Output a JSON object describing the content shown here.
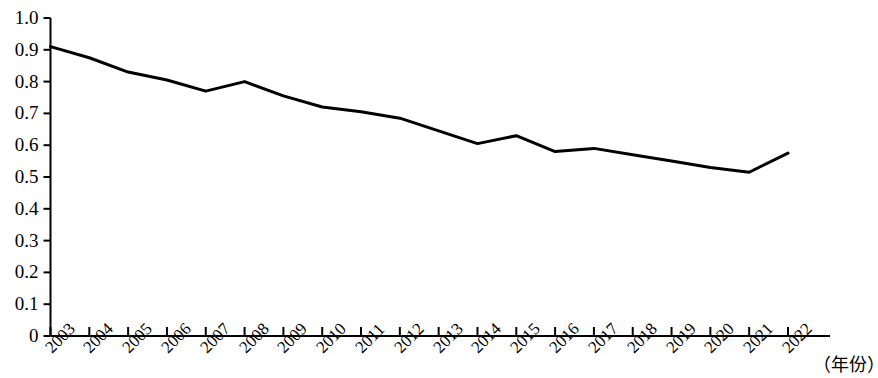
{
  "chart_data": {
    "type": "line",
    "title": "",
    "subtitle": "",
    "xlabel": "（年份）",
    "ylabel": "",
    "categories": [
      "2003",
      "2004",
      "2005",
      "2006",
      "2007",
      "2008",
      "2009",
      "2010",
      "2011",
      "2012",
      "2013",
      "2014",
      "2015",
      "2016",
      "2017",
      "2018",
      "2019",
      "2020",
      "2021",
      "2022"
    ],
    "values": [
      0.91,
      0.875,
      0.83,
      0.805,
      0.77,
      0.8,
      0.755,
      0.72,
      0.705,
      0.685,
      0.645,
      0.605,
      0.63,
      0.58,
      0.59,
      0.57,
      0.55,
      0.53,
      0.515,
      0.575
    ],
    "series": [
      {
        "name": "",
        "values": [
          0.91,
          0.875,
          0.83,
          0.805,
          0.77,
          0.8,
          0.755,
          0.72,
          0.705,
          0.685,
          0.645,
          0.605,
          0.63,
          0.58,
          0.59,
          0.57,
          0.55,
          0.53,
          0.515,
          0.575
        ]
      }
    ],
    "ylim": [
      0,
      1.0
    ],
    "ytick_labels": [
      "0",
      "0.1",
      "0.2",
      "0.3",
      "0.4",
      "0.5",
      "0.6",
      "0.7",
      "0.8",
      "0.9",
      "1.0"
    ],
    "ytick_values": [
      0,
      0.1,
      0.2,
      0.3,
      0.4,
      0.5,
      0.6,
      0.7,
      0.8,
      0.9,
      1.0
    ],
    "grid": false,
    "legend": null,
    "legend_position": "none",
    "line_color": "#000000",
    "axis_color": "#000000",
    "background_color": "#ffffff",
    "markers": false,
    "annotations": []
  }
}
